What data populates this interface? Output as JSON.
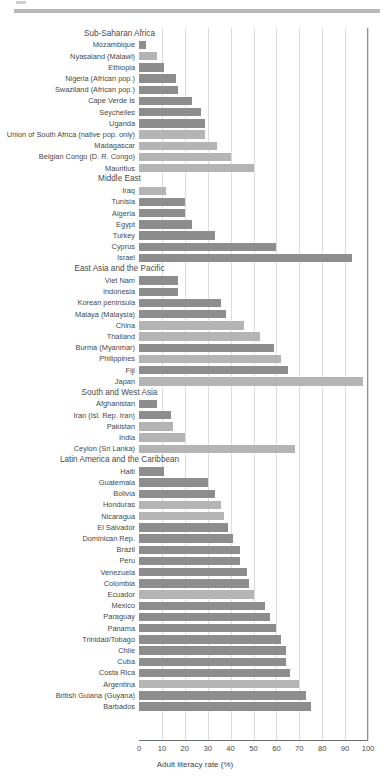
{
  "axis": {
    "xlabel": "Adult literacy rate (%)",
    "ticks": [
      "0",
      "10",
      "20",
      "30",
      "40",
      "50",
      "60",
      "70",
      "80",
      "90",
      "100"
    ],
    "xmin": 0,
    "xmax": 100
  },
  "colors": {
    "bar_dark": "#8d8d8d",
    "bar_light": "#b4b4b4",
    "gridline": "#dcdcdc",
    "axis": "#6e6e6e",
    "text": "#474747",
    "rule": "#b9b9b9"
  },
  "chart_data": {
    "type": "bar",
    "orientation": "horizontal",
    "title": "",
    "xlabel": "Adult literacy rate (%)",
    "ylabel": "",
    "xlim": [
      0,
      100
    ],
    "grid": true,
    "legend": "none",
    "groups": [
      {
        "name": "Sub-Saharan Africa",
        "categories": [
          "Mozambique",
          "Nyasaland (Malawi)",
          "Ethiopia",
          "Nigeria (African pop.)",
          "Swaziland (African pop.)",
          "Cape Verde Is",
          "Seychelles",
          "Uganda",
          "Union of South Africa (native pop. only)",
          "Madagascar",
          "Belgian Congo (D. R. Congo)",
          "Mauritius"
        ],
        "values": [
          3,
          8,
          11,
          16,
          17,
          23,
          27,
          29,
          29,
          34,
          40,
          50
        ],
        "shades": [
          "dark",
          "light",
          "dark",
          "dark",
          "dark",
          "dark",
          "dark",
          "dark",
          "light",
          "light",
          "light",
          "light"
        ]
      },
      {
        "name": "Middle East",
        "categories": [
          "Iraq",
          "Tunisia",
          "Algeria",
          "Egypt",
          "Turkey",
          "Cyprus",
          "Israel"
        ],
        "values": [
          12,
          20,
          20,
          23,
          33,
          60,
          93
        ],
        "shades": [
          "light",
          "dark",
          "dark",
          "dark",
          "dark",
          "dark",
          "dark"
        ]
      },
      {
        "name": "East Asia and the Pacific",
        "categories": [
          "Viet Nam",
          "Indonesia",
          "Korean peninsula",
          "Malaya (Malaysia)",
          "China",
          "Thailand",
          "Burma (Myanmar)",
          "Philippines",
          "Fiji",
          "Japan"
        ],
        "values": [
          17,
          17,
          36,
          38,
          46,
          53,
          59,
          62,
          65,
          98
        ],
        "shades": [
          "dark",
          "dark",
          "dark",
          "dark",
          "light",
          "light",
          "dark",
          "light",
          "dark",
          "light"
        ]
      },
      {
        "name": "South and West Asia",
        "categories": [
          "Afghanistan",
          "Iran (Isl. Rep. Iran)",
          "Pakistan",
          "India",
          "Ceylon  (Sri Lanka)"
        ],
        "values": [
          8,
          14,
          15,
          20,
          68
        ],
        "shades": [
          "dark",
          "dark",
          "light",
          "light",
          "light"
        ]
      },
      {
        "name": "Latin America and the Caribbean",
        "categories": [
          "Haiti",
          "Guatemala",
          "Bolivia",
          "Honduras",
          "Nicaragua",
          "El Salvador",
          "Dominican Rep.",
          "Brazil",
          "Peru",
          "Venezuela",
          "Colombia",
          "Ecuador",
          "Mexico",
          "Paraguay",
          "Panama",
          "Trinidad/Tobago",
          "Chile",
          "Cuba",
          "Costa Rica",
          "Argentina",
          "British Guiana (Guyana)",
          "Barbados"
        ],
        "values": [
          11,
          30,
          33,
          36,
          37,
          39,
          41,
          44,
          44,
          47,
          48,
          50,
          55,
          57,
          60,
          62,
          64,
          64,
          66,
          70,
          73,
          75
        ],
        "shades": [
          "dark",
          "dark",
          "dark",
          "light",
          "light",
          "dark",
          "dark",
          "dark",
          "dark",
          "dark",
          "dark",
          "light",
          "dark",
          "dark",
          "dark",
          "dark",
          "dark",
          "dark",
          "dark",
          "light",
          "dark",
          "dark"
        ]
      }
    ]
  }
}
